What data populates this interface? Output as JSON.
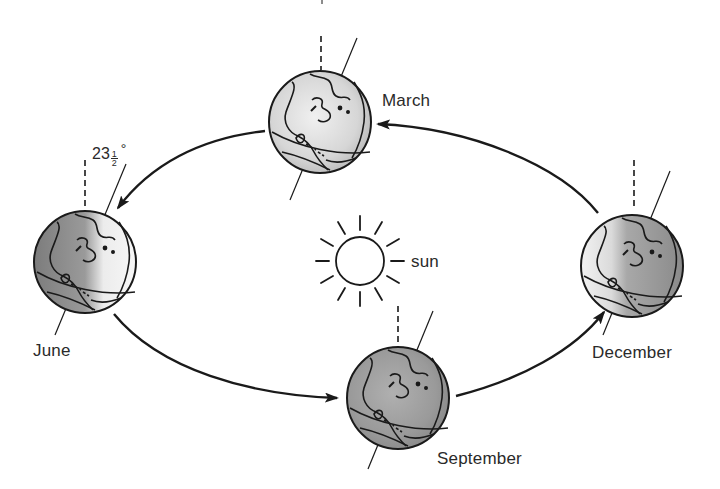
{
  "diagram": {
    "center": {
      "label": "sun",
      "icon": "sun-icon"
    },
    "tilt": {
      "whole": "23",
      "numerator": "1",
      "denominator": "2",
      "unit": "°",
      "value_text": "23½°"
    },
    "positions": [
      {
        "id": "march",
        "label": "March"
      },
      {
        "id": "june",
        "label": "June"
      },
      {
        "id": "september",
        "label": "September"
      },
      {
        "id": "december",
        "label": "December"
      }
    ],
    "orbit_direction": "counterclockwise (December → March → June → September → December)",
    "colors": {
      "line": "#1a1a1a",
      "text": "#2a2a2a",
      "globe_dark": "#8a8a8a",
      "globe_light": "#f2f2f2",
      "background": "#ffffff"
    }
  }
}
